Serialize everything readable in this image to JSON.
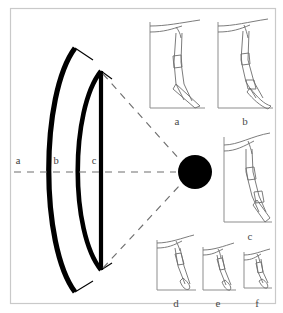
{
  "figure": {
    "background_color": "#ffffff",
    "border_color": "#c9c9c9",
    "curve_color": "#000000",
    "dash_color": "#6e6e6e",
    "hub_color": "#000000",
    "panel_outline_color": "#8d8d8d",
    "profile_line_color": "#6d6d6d"
  },
  "section_labels": [
    {
      "id": "a",
      "text": "a",
      "x": 18,
      "y": 164
    },
    {
      "id": "b",
      "text": "b",
      "x": 56,
      "y": 164
    },
    {
      "id": "c",
      "text": "c",
      "x": 94,
      "y": 164
    }
  ],
  "panels": [
    {
      "id": "a",
      "label": "a",
      "label_x": 177,
      "label_y": 125
    },
    {
      "id": "b",
      "label": "b",
      "label_x": 245,
      "label_y": 125
    },
    {
      "id": "c",
      "label": "c",
      "label_x": 250,
      "label_y": 240
    },
    {
      "id": "d",
      "label": "d",
      "label_x": 176,
      "label_y": 307
    },
    {
      "id": "e",
      "label": "e",
      "label_x": 218,
      "label_y": 307
    },
    {
      "id": "f",
      "label": "f",
      "label_x": 257,
      "label_y": 307
    }
  ],
  "hub": {
    "name": "center-node",
    "cx": 195,
    "cy": 172,
    "r": 17
  }
}
